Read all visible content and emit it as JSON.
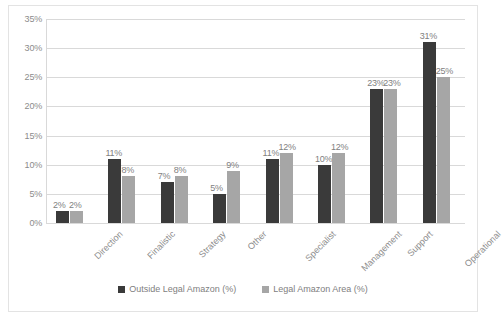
{
  "chart_data": {
    "type": "bar",
    "title": "",
    "xlabel": "",
    "ylabel": "",
    "ylim": [
      0,
      35
    ],
    "yticks": [
      "0%",
      "5%",
      "10%",
      "15%",
      "20%",
      "25%",
      "30%",
      "35%"
    ],
    "ytick_values": [
      0,
      5,
      10,
      15,
      20,
      25,
      30,
      35
    ],
    "grid": true,
    "legend_position": "bottom",
    "categories": [
      "Direction",
      "Finalistic",
      "Strategy",
      "Other",
      "Specialist",
      "Management",
      "Support",
      "Operational"
    ],
    "series": [
      {
        "name": "Outside Legal Amazon  (%)",
        "color": "#3a3a3a",
        "values": [
          2,
          11,
          7,
          5,
          11,
          10,
          23,
          31
        ],
        "labels": [
          "2%",
          "11%",
          "7%",
          "5%",
          "11%",
          "10%",
          "23%",
          "31%"
        ]
      },
      {
        "name": "Legal Amazon Area (%)",
        "color": "#a6a6a6",
        "values": [
          2,
          8,
          8,
          9,
          12,
          12,
          23,
          25
        ],
        "labels": [
          "2%",
          "8%",
          "8%",
          "9%",
          "12%",
          "12%",
          "23%",
          "25%"
        ]
      }
    ]
  },
  "colors": {
    "series_dark": "#3a3a3a",
    "series_light": "#a6a6a6",
    "gridline": "#d9d9d9",
    "text": "#808080",
    "border": "#e3e3e3",
    "background": "#ffffff"
  }
}
